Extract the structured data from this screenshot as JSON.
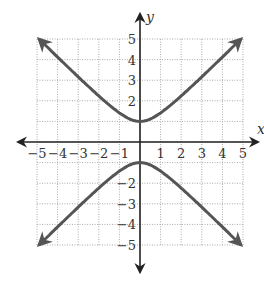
{
  "chart_data": {
    "type": "line",
    "title": "",
    "equation": "y^2 - x^2 = 1",
    "xlabel": "x",
    "ylabel": "y",
    "xlim": [
      -5,
      5
    ],
    "ylim": [
      -5,
      5
    ],
    "grid": true,
    "grid_style": "dotted",
    "x_ticks": [
      "-5",
      "-4",
      "-3",
      "-2",
      "-1",
      "1",
      "2",
      "3",
      "4",
      "5"
    ],
    "y_ticks": [
      "5",
      "4",
      "3",
      "2",
      "-2",
      "-3",
      "-4",
      "-5"
    ],
    "series": [
      {
        "name": "upper branch",
        "x": [
          -4.9,
          -4,
          -3,
          -2,
          -1,
          0,
          1,
          2,
          3,
          4,
          4.9
        ],
        "y": [
          5.0,
          4.12,
          3.16,
          2.24,
          1.41,
          1,
          1.41,
          2.24,
          3.16,
          4.12,
          5.0
        ],
        "arrows": "both ends"
      },
      {
        "name": "lower branch",
        "x": [
          -4.9,
          -4,
          -3,
          -2,
          -1,
          0,
          1,
          2,
          3,
          4,
          4.9
        ],
        "y": [
          -5.0,
          -4.12,
          -3.16,
          -2.24,
          -1.41,
          -1,
          -1.41,
          -2.24,
          -3.16,
          -4.12,
          -5.0
        ],
        "arrows": "both ends"
      }
    ],
    "colors": {
      "curve": "#555555",
      "axis": "#222222",
      "grid": "#aaaaaa"
    }
  }
}
